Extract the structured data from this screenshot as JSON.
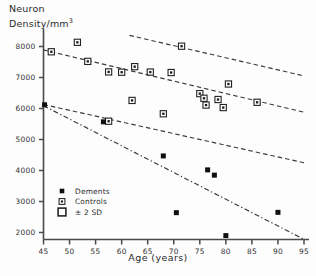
{
  "axis_titles": {
    "y_line1": "Neuron",
    "y_line2": "Density/mm",
    "y_superscript": "3",
    "x": "Age (years)"
  },
  "legend": {
    "items": [
      {
        "label": "Dements",
        "marker": "filled-square"
      },
      {
        "label": "Controls",
        "marker": "dotted-square"
      },
      {
        "label": "± 2 SD",
        "marker": "open-square"
      }
    ]
  },
  "chart_data": {
    "type": "scatter",
    "title": "",
    "xlabel": "Age (years)",
    "ylabel": "Neuron Density/mm3",
    "xlim": [
      45,
      95
    ],
    "ylim": [
      1500,
      8600
    ],
    "xticks": [
      45,
      50,
      55,
      60,
      65,
      70,
      75,
      80,
      85,
      90,
      95
    ],
    "yticks": [
      2000,
      3000,
      4000,
      5000,
      6000,
      7000,
      8000
    ],
    "ytick_labels": [
      "2000",
      "3000",
      "4000",
      "5000",
      "6000",
      "7000",
      "8000"
    ],
    "xtick_labels": [
      "45",
      "50",
      "55",
      "60",
      "65",
      "70",
      "75",
      "80",
      "85",
      "90",
      "95"
    ],
    "grid": false,
    "legend_position": "lower-left",
    "series": [
      {
        "name": "Controls",
        "marker": "dotted-square",
        "points": [
          [
            46.5,
            7830
          ],
          [
            51.5,
            8135
          ],
          [
            53.5,
            7520
          ],
          [
            57.5,
            7180
          ],
          [
            60.0,
            7170
          ],
          [
            62.5,
            7350
          ],
          [
            65.5,
            7175
          ],
          [
            69.5,
            7160
          ],
          [
            71.5,
            8010
          ],
          [
            75.0,
            6480
          ],
          [
            75.8,
            6330
          ],
          [
            76.2,
            6110
          ],
          [
            78.5,
            6290
          ],
          [
            80.5,
            6790
          ],
          [
            79.5,
            6030
          ],
          [
            86.0,
            6200
          ],
          [
            62.0,
            6260
          ],
          [
            68.0,
            5830
          ],
          [
            57.5,
            5590
          ]
        ]
      },
      {
        "name": "Dements",
        "marker": "filled-square",
        "points": [
          [
            45.2,
            6120
          ],
          [
            56.5,
            5570
          ],
          [
            68.0,
            4470
          ],
          [
            76.5,
            4020
          ],
          [
            77.8,
            3850
          ],
          [
            70.5,
            2640
          ],
          [
            90.0,
            2650
          ],
          [
            80.0,
            1900
          ]
        ]
      }
    ],
    "lines": [
      {
        "name": "controls-regression",
        "style": "dashed",
        "x": [
          45,
          95
        ],
        "y": [
          7890,
          5880
        ]
      },
      {
        "name": "plus-2sd",
        "style": "dashed",
        "x": [
          61.5,
          95
        ],
        "y": [
          8360,
          7050
        ]
      },
      {
        "name": "minus-2sd",
        "style": "dashed",
        "x": [
          45,
          95
        ],
        "y": [
          6130,
          4250
        ]
      },
      {
        "name": "dements-regression",
        "style": "dash-dot",
        "x": [
          45,
          95
        ],
        "y": [
          6090,
          1780
        ]
      }
    ]
  }
}
